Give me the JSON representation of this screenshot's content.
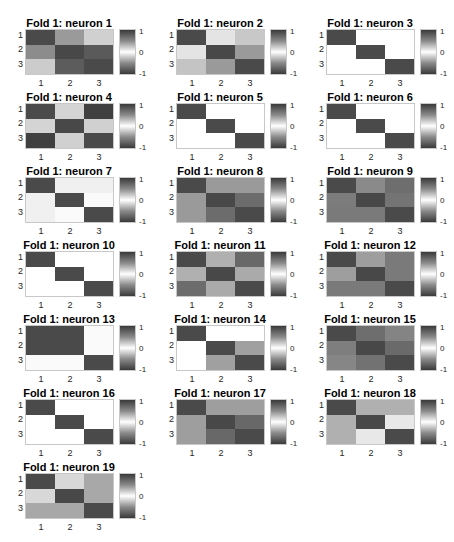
{
  "figure": {
    "colorbar_ticks": [
      "1",
      "0",
      "-1"
    ],
    "x_ticks": [
      "1",
      "2",
      "3"
    ],
    "y_ticks": [
      "1",
      "2",
      "3"
    ]
  },
  "chart_data": {
    "type": "heatmap",
    "clim": [
      -1,
      1
    ],
    "xlabel": "",
    "ylabel": "",
    "x_ticks": [
      1,
      2,
      3
    ],
    "y_ticks": [
      1,
      2,
      3
    ],
    "panels": [
      {
        "title": "Fold 1: neuron 1",
        "cells": [
          [
            "#4a4a4a",
            "#9a9a9a",
            "#d0d0d0"
          ],
          [
            "#8c8c8c",
            "#484848",
            "#5a5a5a"
          ],
          [
            "#cccccc",
            "#5c5c5c",
            "#4a4a4a"
          ]
        ]
      },
      {
        "title": "Fold 1: neuron 2",
        "cells": [
          [
            "#4a4a4a",
            "#e4e4e4",
            "#c8c8c8"
          ],
          [
            "#e4e4e4",
            "#484848",
            "#9a9a9a"
          ],
          [
            "#c4c4c4",
            "#9a9a9a",
            "#4a4a4a"
          ]
        ]
      },
      {
        "title": "Fold 1: neuron 3",
        "cells": [
          [
            "#4a4a4a",
            "#ffffff",
            "#ffffff"
          ],
          [
            "#ffffff",
            "#4a4a4a",
            "#ffffff"
          ],
          [
            "#ffffff",
            "#ffffff",
            "#4a4a4a"
          ]
        ]
      },
      {
        "title": "Fold 1: neuron 4",
        "cells": [
          [
            "#4a4a4a",
            "#d4d4d4",
            "#404040"
          ],
          [
            "#d4d4d4",
            "#484848",
            "#d0d0d0"
          ],
          [
            "#404040",
            "#d0d0d0",
            "#4a4a4a"
          ]
        ]
      },
      {
        "title": "Fold 1: neuron 5",
        "cells": [
          [
            "#4a4a4a",
            "#ffffff",
            "#ffffff"
          ],
          [
            "#ffffff",
            "#4a4a4a",
            "#ffffff"
          ],
          [
            "#ffffff",
            "#ffffff",
            "#4a4a4a"
          ]
        ]
      },
      {
        "title": "Fold 1: neuron 6",
        "cells": [
          [
            "#4a4a4a",
            "#ffffff",
            "#ffffff"
          ],
          [
            "#ffffff",
            "#4a4a4a",
            "#ffffff"
          ],
          [
            "#ffffff",
            "#ffffff",
            "#4a4a4a"
          ]
        ]
      },
      {
        "title": "Fold 1: neuron 7",
        "cells": [
          [
            "#4a4a4a",
            "#f0f0f0",
            "#f0f0f0"
          ],
          [
            "#f0f0f0",
            "#4a4a4a",
            "#fafafa"
          ],
          [
            "#f0f0f0",
            "#fafafa",
            "#4a4a4a"
          ]
        ]
      },
      {
        "title": "Fold 1: neuron 8",
        "cells": [
          [
            "#4a4a4a",
            "#9a9a9a",
            "#9a9a9a"
          ],
          [
            "#9a9a9a",
            "#484848",
            "#6c6c6c"
          ],
          [
            "#9a9a9a",
            "#6c6c6c",
            "#4a4a4a"
          ]
        ]
      },
      {
        "title": "Fold 1: neuron 9",
        "cells": [
          [
            "#4a4a4a",
            "#8a8a8a",
            "#6e6e6e"
          ],
          [
            "#7c7c7c",
            "#484848",
            "#747474"
          ],
          [
            "#7a7a7a",
            "#7a7a7a",
            "#4a4a4a"
          ]
        ]
      },
      {
        "title": "Fold 1: neuron 10",
        "cells": [
          [
            "#4a4a4a",
            "#ffffff",
            "#ffffff"
          ],
          [
            "#ffffff",
            "#4a4a4a",
            "#ffffff"
          ],
          [
            "#ffffff",
            "#ffffff",
            "#4a4a4a"
          ]
        ]
      },
      {
        "title": "Fold 1: neuron 11",
        "cells": [
          [
            "#4a4a4a",
            "#b0b0b0",
            "#686868"
          ],
          [
            "#b0b0b0",
            "#484848",
            "#aaaaaa"
          ],
          [
            "#6c6c6c",
            "#aaaaaa",
            "#4a4a4a"
          ]
        ]
      },
      {
        "title": "Fold 1: neuron 12",
        "cells": [
          [
            "#4a4a4a",
            "#9e9e9e",
            "#7a7a7a"
          ],
          [
            "#9e9e9e",
            "#484848",
            "#7a7a7a"
          ],
          [
            "#7a7a7a",
            "#7a7a7a",
            "#4a4a4a"
          ]
        ]
      },
      {
        "title": "Fold 1: neuron 13",
        "cells": [
          [
            "#4a4a4a",
            "#4a4a4a",
            "#fafafa"
          ],
          [
            "#4a4a4a",
            "#4a4a4a",
            "#fafafa"
          ],
          [
            "#fafafa",
            "#fafafa",
            "#4a4a4a"
          ]
        ]
      },
      {
        "title": "Fold 1: neuron 14",
        "cells": [
          [
            "#4a4a4a",
            "#ffffff",
            "#ffffff"
          ],
          [
            "#ffffff",
            "#4a4a4a",
            "#a0a0a0"
          ],
          [
            "#ffffff",
            "#a0a0a0",
            "#4a4a4a"
          ]
        ]
      },
      {
        "title": "Fold 1: neuron 15",
        "cells": [
          [
            "#4a4a4a",
            "#6e6e6e",
            "#848484"
          ],
          [
            "#7e7e7e",
            "#484848",
            "#6a6a6a"
          ],
          [
            "#868686",
            "#727272",
            "#4a4a4a"
          ]
        ]
      },
      {
        "title": "Fold 1: neuron 16",
        "cells": [
          [
            "#4a4a4a",
            "#ffffff",
            "#ffffff"
          ],
          [
            "#ffffff",
            "#4a4a4a",
            "#ffffff"
          ],
          [
            "#ffffff",
            "#ffffff",
            "#4a4a4a"
          ]
        ]
      },
      {
        "title": "Fold 1: neuron 17",
        "cells": [
          [
            "#4a4a4a",
            "#9e9e9e",
            "#9e9e9e"
          ],
          [
            "#9e9e9e",
            "#484848",
            "#686868"
          ],
          [
            "#9e9e9e",
            "#686868",
            "#4a4a4a"
          ]
        ]
      },
      {
        "title": "Fold 1: neuron 18",
        "cells": [
          [
            "#4a4a4a",
            "#b0b0b0",
            "#b0b0b0"
          ],
          [
            "#b0b0b0",
            "#484848",
            "#e8e8e8"
          ],
          [
            "#b0b0b0",
            "#e8e8e8",
            "#4a4a4a"
          ]
        ]
      },
      {
        "title": "Fold 1: neuron 19",
        "cells": [
          [
            "#4a4a4a",
            "#d8d8d8",
            "#a8a8a8"
          ],
          [
            "#d8d8d8",
            "#484848",
            "#a8a8a8"
          ],
          [
            "#a8a8a8",
            "#a8a8a8",
            "#4a4a4a"
          ]
        ]
      }
    ]
  },
  "layout": {
    "columns_x": [
      1,
      152,
      302
    ],
    "rows_y": [
      17,
      91,
      165,
      239,
      313,
      387,
      461
    ]
  }
}
